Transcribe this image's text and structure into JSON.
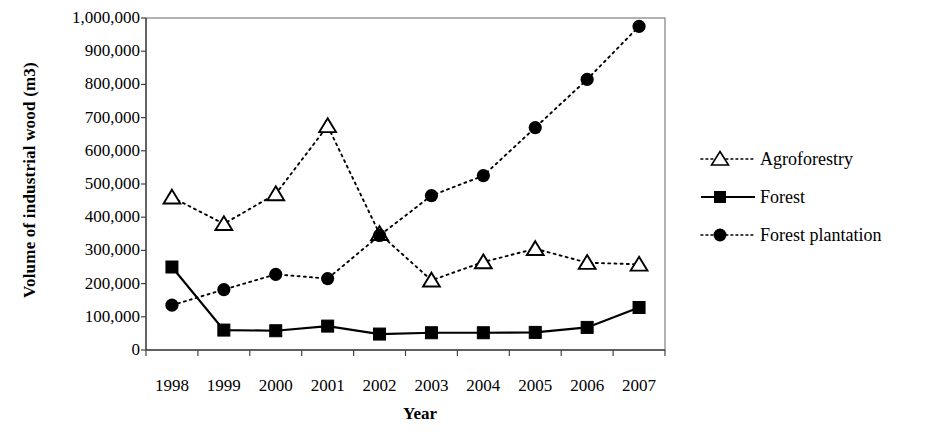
{
  "chart_data": {
    "type": "line",
    "title": "",
    "xlabel": "Year",
    "ylabel": "Volume of industrial wood (m3)",
    "categories": [
      "1998",
      "1999",
      "2000",
      "2001",
      "2002",
      "2003",
      "2004",
      "2005",
      "2006",
      "2007"
    ],
    "x": [
      1998,
      1999,
      2000,
      2001,
      2002,
      2003,
      2004,
      2005,
      2006,
      2007
    ],
    "ylim": [
      0,
      1000000
    ],
    "xlim": [
      1997.5,
      2007.5
    ],
    "ytick_labels": [
      "0",
      "100,000",
      "200,000",
      "300,000",
      "400,000",
      "500,000",
      "600,000",
      "700,000",
      "800,000",
      "900,000",
      "1,000,000"
    ],
    "ytick_values": [
      0,
      100000,
      200000,
      300000,
      400000,
      500000,
      600000,
      700000,
      800000,
      900000,
      1000000
    ],
    "grid": false,
    "legend_position": "right",
    "series": [
      {
        "name": "Agroforestry",
        "marker": "open-triangle",
        "line_style": "dotted",
        "color": "#000000",
        "values": [
          460000,
          380000,
          470000,
          675000,
          350000,
          210000,
          265000,
          305000,
          263000,
          258000
        ]
      },
      {
        "name": "Forest",
        "marker": "filled-square",
        "line_style": "solid",
        "color": "#000000",
        "values": [
          250000,
          60000,
          58000,
          72000,
          48000,
          52000,
          52000,
          53000,
          68000,
          128000
        ]
      },
      {
        "name": "Forest plantation",
        "marker": "filled-circle",
        "line_style": "dotted",
        "color": "#000000",
        "values": [
          135000,
          182000,
          228000,
          215000,
          345000,
          465000,
          525000,
          670000,
          815000,
          975000
        ]
      }
    ]
  },
  "legend": {
    "items": [
      {
        "label": "Agroforestry"
      },
      {
        "label": "Forest"
      },
      {
        "label": "Forest plantation"
      }
    ]
  },
  "axes": {
    "x_title": "Year",
    "y_title": "Volume of industrial wood (m3)"
  }
}
